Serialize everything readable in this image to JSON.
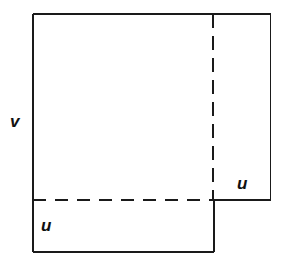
{
  "figure": {
    "type": "geometric-diagram",
    "canvas": {
      "width": 291,
      "height": 262,
      "background": "#ffffff"
    },
    "style": {
      "stroke_color": "#1a1a1a",
      "solid_stroke_width": 1.6,
      "dashed_stroke_width": 1.8,
      "dash_pattern_horizontal": "13 9",
      "dash_pattern_vertical": "14 8",
      "label_color": "#111111"
    },
    "geometry": {
      "outer_left": 33,
      "outer_top": 14,
      "outer_right": 271,
      "outer_bottom": 252,
      "split_x": 213,
      "split_y": 200
    },
    "labels": [
      {
        "id": "v",
        "text": "v",
        "x": 16,
        "y": 123,
        "position": "left-middle-outside"
      },
      {
        "id": "u-bottom",
        "text": "u",
        "x": 47,
        "y": 227,
        "position": "bottom-left-inside"
      },
      {
        "id": "u-right",
        "text": "u",
        "x": 243,
        "y": 185,
        "position": "right-lower-inside"
      }
    ],
    "segments": [
      {
        "id": "top-edge",
        "kind": "solid",
        "x1": 33,
        "y1": 14,
        "x2": 271,
        "y2": 14
      },
      {
        "id": "left-edge-upper",
        "kind": "solid",
        "x1": 33,
        "y1": 14,
        "x2": 33,
        "y2": 200
      },
      {
        "id": "left-edge-lower",
        "kind": "solid",
        "x1": 33,
        "y1": 200,
        "x2": 33,
        "y2": 252
      },
      {
        "id": "bottom-edge-lower-left",
        "kind": "solid",
        "x1": 33,
        "y1": 252,
        "x2": 214,
        "y2": 252
      },
      {
        "id": "right-edge-lower-block",
        "kind": "solid",
        "x1": 214,
        "y1": 200,
        "x2": 214,
        "y2": 252
      },
      {
        "id": "right-block-bottom-edge",
        "kind": "solid",
        "x1": 213,
        "y1": 200,
        "x2": 271,
        "y2": 200
      },
      {
        "id": "right-edge-upper",
        "kind": "solid",
        "x1": 271,
        "y1": 14,
        "x2": 271,
        "y2": 200
      },
      {
        "id": "vertical-divider",
        "kind": "dashed",
        "x1": 213,
        "y1": 14,
        "x2": 213,
        "y2": 200
      },
      {
        "id": "horizontal-divider",
        "kind": "dashed",
        "x1": 33,
        "y1": 200,
        "x2": 213,
        "y2": 200
      }
    ]
  }
}
